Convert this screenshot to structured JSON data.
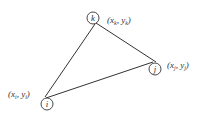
{
  "diagram": {
    "type": "triangle-element",
    "nodes": [
      {
        "id": "k",
        "label": "k",
        "coord_label": "(xₖ, yₖ)",
        "coord_x": "x",
        "coord_y": "y",
        "sub": "k"
      },
      {
        "id": "j",
        "label": "j",
        "coord_label": "(xⱼ, yⱼ)",
        "coord_x": "x",
        "coord_y": "y",
        "sub": "j"
      },
      {
        "id": "i",
        "label": "i",
        "coord_label": "(xᵢ, yᵢ)",
        "coord_x": "x",
        "coord_y": "y",
        "sub": "i"
      }
    ],
    "edges": [
      {
        "from": "k",
        "to": "i"
      },
      {
        "from": "k",
        "to": "j"
      },
      {
        "from": "i",
        "to": "j"
      }
    ],
    "colors": {
      "stroke": "#333333",
      "background": "#ffffff"
    }
  }
}
